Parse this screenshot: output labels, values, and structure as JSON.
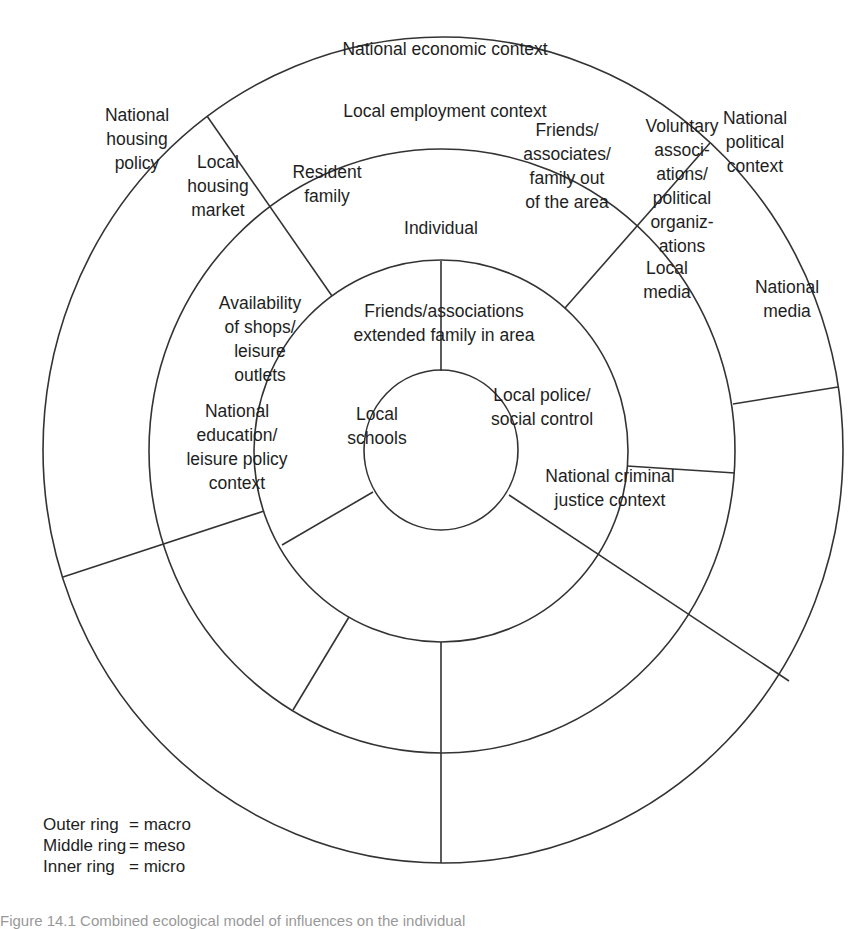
{
  "diagram": {
    "title": "Ecological model of influences on the individual",
    "stroke_color": "#333333",
    "rings": [
      {
        "name": "outer-ring",
        "level": "macro",
        "cx": 443,
        "cy": 450,
        "rx": 400,
        "ry": 413
      },
      {
        "name": "middle-ring",
        "level": "meso",
        "cx": 442,
        "cy": 451,
        "rx": 293,
        "ry": 302
      },
      {
        "name": "inner-ring",
        "level": "micro",
        "cx": 441,
        "cy": 451,
        "rx": 187,
        "ry": 191
      },
      {
        "name": "individual-circle",
        "level": "core",
        "cx": 441,
        "cy": 450,
        "rx": 77,
        "ry": 80
      }
    ],
    "dividers": [
      {
        "name": "divider-economic-housing",
        "x1": 207,
        "y1": 116,
        "x2": 332,
        "y2": 296
      },
      {
        "name": "divider-economic-political",
        "x1": 710,
        "y1": 143,
        "x2": 565,
        "y2": 308
      },
      {
        "name": "divider-political-media",
        "x1": 733,
        "y1": 404,
        "x2": 838,
        "y2": 387
      },
      {
        "name": "divider-voluntary-localmedia",
        "x1": 627,
        "y1": 466,
        "x2": 735,
        "y2": 473
      },
      {
        "name": "divider-media-criminal",
        "x1": 509,
        "y1": 495,
        "x2": 789,
        "y2": 681
      },
      {
        "name": "divider-bottom-vertical",
        "x1": 441,
        "y1": 642,
        "x2": 441,
        "y2": 863
      },
      {
        "name": "divider-schools-shops",
        "x1": 349,
        "y1": 617,
        "x2": 293,
        "y2": 710
      },
      {
        "name": "divider-housing-education",
        "x1": 63,
        "y1": 577,
        "x2": 264,
        "y2": 511
      },
      {
        "name": "divider-family-friends-area",
        "x1": 282,
        "y1": 545,
        "x2": 373,
        "y2": 492
      },
      {
        "name": "divider-top-vertical",
        "x1": 441,
        "y1": 261,
        "x2": 441,
        "y2": 371
      }
    ],
    "labels": [
      {
        "name": "label-national-economic-context",
        "ring": "outer",
        "x": 445,
        "y": 98,
        "anchor": "middle",
        "lines": [
          "National economic context"
        ]
      },
      {
        "name": "label-national-housing-policy",
        "ring": "outer",
        "x": 137,
        "y": 277,
        "anchor": "middle",
        "lines": [
          "National",
          "housing",
          "policy"
        ]
      },
      {
        "name": "label-national-political-context",
        "ring": "outer",
        "x": 755,
        "y": 283,
        "anchor": "middle",
        "lines": [
          "National",
          "political",
          "context"
        ]
      },
      {
        "name": "label-national-media",
        "ring": "outer",
        "x": 787,
        "y": 598,
        "anchor": "middle",
        "lines": [
          "National",
          "media"
        ]
      },
      {
        "name": "label-national-criminal-justice-context",
        "ring": "outer",
        "x": 610,
        "y": 976,
        "anchor": "middle",
        "lines": [
          "National criminal",
          "justice context"
        ]
      },
      {
        "name": "label-national-education-leisure-policy-context",
        "ring": "outer",
        "x": 237,
        "y": 894,
        "anchor": "middle",
        "lines": [
          "National",
          "education/",
          "leisure policy",
          "context"
        ]
      },
      {
        "name": "label-local-employment-context",
        "ring": "middle",
        "x": 445,
        "y": 222,
        "anchor": "middle",
        "lines": [
          "Local employment context"
        ]
      },
      {
        "name": "label-local-housing-market",
        "ring": "middle",
        "x": 218,
        "y": 372,
        "anchor": "middle",
        "lines": [
          "Local",
          "housing",
          "market"
        ]
      },
      {
        "name": "label-voluntary-associations",
        "ring": "middle",
        "x": 682,
        "y": 372,
        "anchor": "middle",
        "lines": [
          "Voluntary",
          "associ-",
          "ations/",
          "political",
          "organiz-",
          "ations"
        ]
      },
      {
        "name": "label-local-media",
        "ring": "middle",
        "x": 667,
        "y": 559,
        "anchor": "middle",
        "lines": [
          "Local",
          "media"
        ]
      },
      {
        "name": "label-availability-shops-leisure",
        "ring": "middle",
        "x": 260,
        "y": 677,
        "anchor": "middle",
        "lines": [
          "Availability",
          "of shops/",
          "leisure",
          "outlets"
        ]
      },
      {
        "name": "label-local-schools",
        "ring": "middle",
        "x": 377,
        "y": 852,
        "anchor": "middle",
        "lines": [
          "Local",
          "schools"
        ]
      },
      {
        "name": "label-local-police-social-control",
        "ring": "middle",
        "x": 542,
        "y": 813,
        "anchor": "middle",
        "lines": [
          "Local police/",
          "social control"
        ]
      },
      {
        "name": "label-resident-family",
        "ring": "inner",
        "x": 327,
        "y": 368,
        "anchor": "middle",
        "lines": [
          "Resident",
          "family"
        ]
      },
      {
        "name": "label-friends-family-out-of-area",
        "ring": "inner",
        "x": 567,
        "y": 332,
        "anchor": "middle",
        "lines": [
          "Friends/",
          "associates/",
          "family out",
          "of the area"
        ]
      },
      {
        "name": "label-friends-extended-family-in-area",
        "ring": "inner",
        "x": 444,
        "y": 646,
        "anchor": "middle",
        "lines": [
          "Friends/associations",
          "extended family in area"
        ]
      },
      {
        "name": "label-individual",
        "ring": "core",
        "x": 441,
        "y": 455,
        "anchor": "middle",
        "lines": [
          "Individual"
        ]
      }
    ],
    "line_height": 24
  },
  "legend": {
    "rows": [
      {
        "key": "Outer ring",
        "value": "= macro"
      },
      {
        "key": "Middle ring",
        "value": "= meso"
      },
      {
        "key": "Inner ring",
        "value": "= micro"
      }
    ]
  },
  "caption": {
    "text": "Figure 14.1 Combined ecological model of influences on the individual"
  }
}
